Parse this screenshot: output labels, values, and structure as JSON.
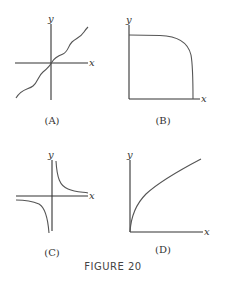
{
  "figure": {
    "caption": "FIGURE 20",
    "panels": [
      {
        "id": "A",
        "label": "(A)",
        "x_axis_label": "x",
        "y_axis_label": "y",
        "curve": "increasing wavy curve through origin"
      },
      {
        "id": "B",
        "label": "(B)",
        "x_axis_label": "x",
        "y_axis_label": "y",
        "curve": "flat then steeply decreasing to x-axis (quarter-ellipse-like)"
      },
      {
        "id": "C",
        "label": "(C)",
        "x_axis_label": "x",
        "y_axis_label": "y",
        "curve": "hyperbola y = 1/x in quadrants I and III"
      },
      {
        "id": "D",
        "label": "(D)",
        "x_axis_label": "x",
        "y_axis_label": "y",
        "curve": "square-root-like increasing concave curve from origin"
      }
    ]
  }
}
